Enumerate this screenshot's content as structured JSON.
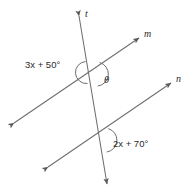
{
  "figure": {
    "background_color": "#ffffff",
    "stroke_color": "#6e6e6e",
    "text_color": "#2b2b2b",
    "width": 194,
    "height": 196
  },
  "lines": [
    {
      "id": "t",
      "label": "t",
      "role": "transversal",
      "label_x": 85,
      "label_y": 9,
      "x1": 79,
      "y1": 16,
      "x2": 107,
      "y2": 184,
      "arrow_start": true,
      "arrow_end": true
    },
    {
      "id": "m",
      "label": "m",
      "role": "parallel-upper",
      "label_x": 144,
      "label_y": 29,
      "x1": 14,
      "y1": 123,
      "x2": 139,
      "y2": 38,
      "arrow_start": true,
      "arrow_end": true
    },
    {
      "id": "n",
      "label": "n",
      "role": "parallel-lower",
      "label_x": 176,
      "label_y": 74,
      "x1": 48,
      "y1": 167,
      "x2": 171,
      "y2": 83,
      "arrow_start": true,
      "arrow_end": true
    }
  ],
  "intersections": [
    {
      "id": "upper",
      "of": "t and m",
      "x": 92,
      "y": 72
    },
    {
      "id": "lower",
      "of": "t and n",
      "x": 101,
      "y": 138
    }
  ],
  "angles": [
    {
      "id": "angle-3x-50",
      "expression": "3x + 50°",
      "coefficient": 3,
      "constant": 50,
      "variable": "x",
      "at_intersection": "upper",
      "side": "left",
      "label_x": 25,
      "label_y": 60,
      "arc_d": "M 85.5 61.5 A 11 11 0 0 0 87.5 83.5"
    },
    {
      "id": "angle-theta",
      "expression": "θ",
      "at_intersection": "upper",
      "side": "right",
      "label_x": 104,
      "label_y": 76,
      "arc_d": "M 99.5 63.0 A 12 12 0 0 1 97.5 86.0"
    },
    {
      "id": "angle-2x-70",
      "expression": "2x + 70°",
      "coefficient": 2,
      "constant": 70,
      "variable": "x",
      "at_intersection": "lower",
      "side": "right",
      "label_x": 113,
      "label_y": 139,
      "arc_d": "M 108.0 129.0 A 12 12 0 0 1 106.5 152.0"
    }
  ]
}
